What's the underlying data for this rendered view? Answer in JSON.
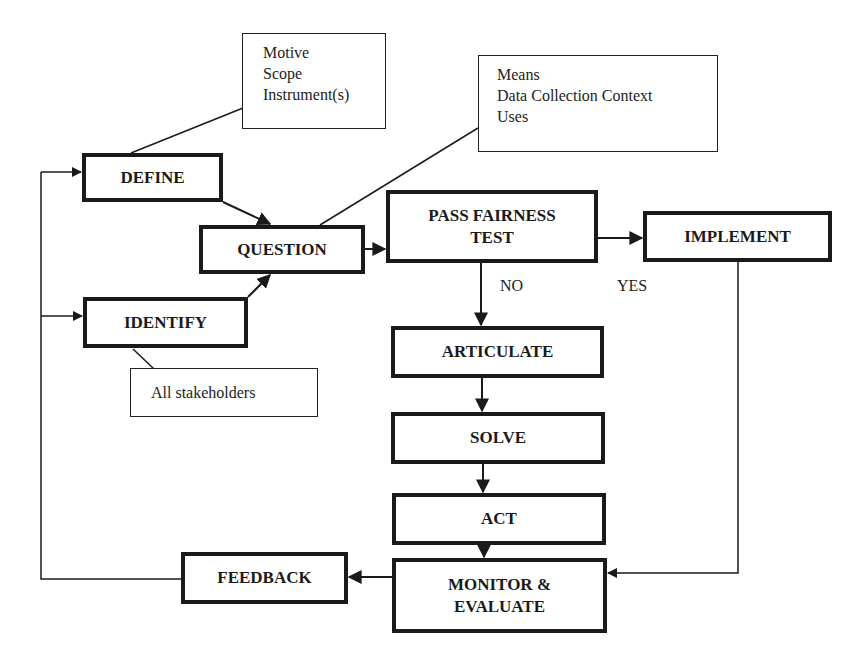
{
  "diagram": {
    "type": "flowchart",
    "nodes": {
      "define": "DEFINE",
      "question": "QUESTION",
      "identify": "IDENTIFY",
      "pass_fairness_line1": "PASS FAIRNESS",
      "pass_fairness_line2": "TEST",
      "implement": "IMPLEMENT",
      "articulate": "ARTICULATE",
      "solve": "SOLVE",
      "act": "ACT",
      "monitor_line1": "MONITOR &",
      "monitor_line2": "EVALUATE",
      "feedback": "FEEDBACK"
    },
    "notes": {
      "define_note": [
        "Motive",
        "Scope",
        "Instrument(s)"
      ],
      "question_note": [
        "Means",
        "Data Collection Context",
        "Uses"
      ],
      "identify_note": [
        "All stakeholders"
      ]
    },
    "edge_labels": {
      "no": "NO",
      "yes": "YES"
    },
    "edges": [
      {
        "from": "DEFINE",
        "to": "QUESTION"
      },
      {
        "from": "IDENTIFY",
        "to": "QUESTION"
      },
      {
        "from": "QUESTION",
        "to": "PASS FAIRNESS TEST"
      },
      {
        "from": "PASS FAIRNESS TEST",
        "to": "IMPLEMENT",
        "label": "YES"
      },
      {
        "from": "PASS FAIRNESS TEST",
        "to": "ARTICULATE",
        "label": "NO"
      },
      {
        "from": "ARTICULATE",
        "to": "SOLVE"
      },
      {
        "from": "SOLVE",
        "to": "ACT"
      },
      {
        "from": "ACT",
        "to": "MONITOR & EVALUATE"
      },
      {
        "from": "IMPLEMENT",
        "to": "MONITOR & EVALUATE"
      },
      {
        "from": "MONITOR & EVALUATE",
        "to": "FEEDBACK"
      },
      {
        "from": "FEEDBACK",
        "to": "DEFINE"
      },
      {
        "from": "FEEDBACK",
        "to": "IDENTIFY"
      }
    ],
    "colors": {
      "stroke": "#1a1a1a",
      "background": "#ffffff"
    }
  }
}
